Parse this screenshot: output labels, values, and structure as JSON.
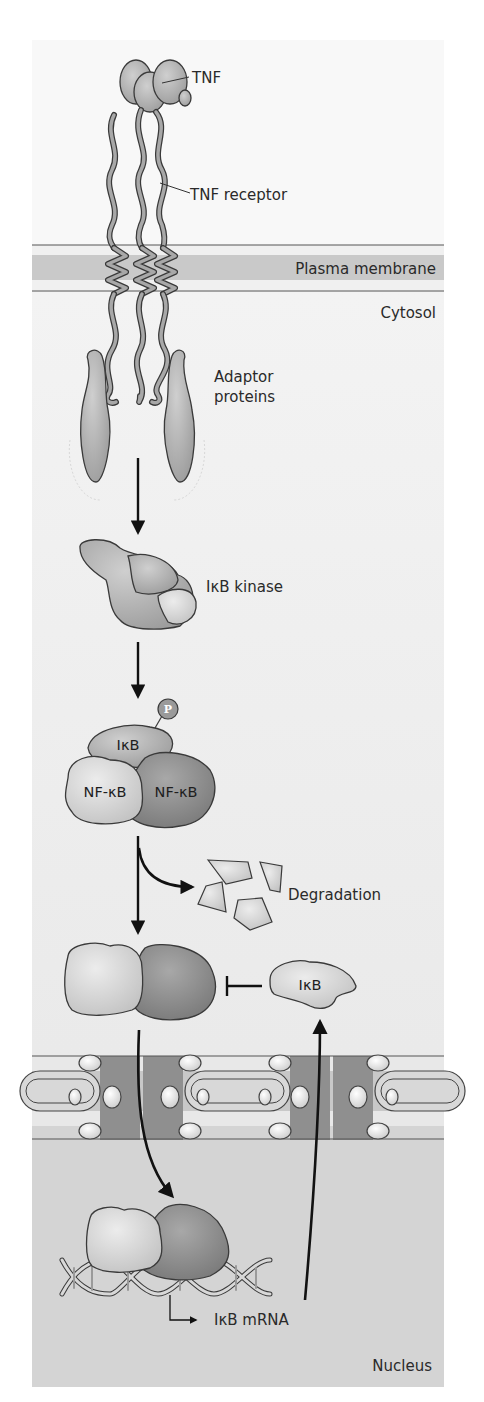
{
  "figure": {
    "colors": {
      "background": "#ffffff",
      "cytosol": "#ececec",
      "membrane_band": "#c9c9c9",
      "nucleus": "#d3d3d3",
      "protein_light": "#d6d6d6",
      "protein_mid": "#b3b3b3",
      "protein_dark": "#8f8f8f",
      "outline": "#3a3a3a",
      "arrow": "#111111"
    },
    "labels": {
      "tnf": "TNF",
      "tnf_receptor": "TNF receptor",
      "plasma_membrane": "Plasma membrane",
      "cytosol": "Cytosol",
      "adaptor_line1": "Adaptor",
      "adaptor_line2": "proteins",
      "ikb_kinase": "IκB kinase",
      "phosphate": "P",
      "ikb_complex": "IκB",
      "nfkb_left": "NF-κB",
      "nfkb_right": "NF-κB",
      "degradation": "Degradation",
      "ikb_free": "IκB",
      "ikb_mrna": "IκB mRNA",
      "nucleus": "Nucleus"
    },
    "steps": [
      "TNF binds TNF receptor",
      "Receptor recruits adaptor proteins",
      "Adaptor proteins activate IκB kinase",
      "IκB kinase phosphorylates IκB bound to NF-κB",
      "Phosphorylated IκB is degraded",
      "Free NF-κB translocates into the nucleus",
      "NF-κB binds DNA and induces IκB mRNA",
      "Newly made IκB inhibits NF-κB"
    ]
  }
}
